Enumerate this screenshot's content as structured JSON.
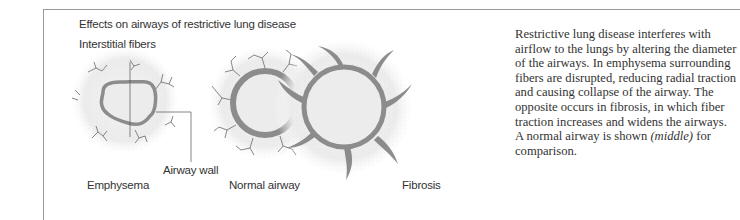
{
  "figure": {
    "title": "Effects on airways of restrictive lung disease",
    "labels": {
      "interstitial_fibers": "Interstitial fibers",
      "airway_wall": "Airway wall",
      "emphysema": "Emphysema",
      "normal_airway": "Normal airway",
      "fibrosis": "Fibrosis"
    },
    "colors": {
      "airway_wall": "#8c8c8c",
      "lumen": "#ededed",
      "fibers": "#6a6a6a",
      "stipple": "#d8d8d8"
    }
  },
  "caption": {
    "text": "Restrictive lung disease interferes with airflow to the lungs by altering the diameter of the airways. In emphysema surrounding fibers are disrupted, reducing radial traction and causing collapse of the airway. The opposite occurs in fibrosis, in which fiber traction increases and widens the airways. A normal airway is shown ",
    "italic": "(middle)",
    "tail": " for comparison."
  }
}
